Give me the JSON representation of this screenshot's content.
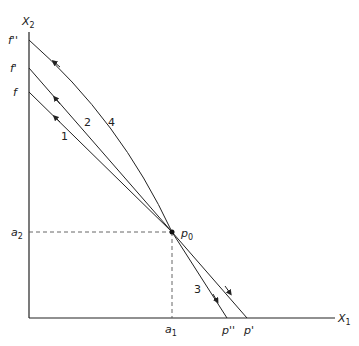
{
  "diagram": {
    "axes": {
      "y_label": "X",
      "y_label_sub": "2",
      "x_label": "X",
      "x_label_sub": "1"
    },
    "y_intercepts": {
      "f_double_prime": "f''",
      "f_prime": "f'",
      "f": "f"
    },
    "x_intercepts": {
      "p_double_prime": "p''",
      "p_prime": "p'"
    },
    "guides": {
      "a1": "a",
      "a1_sub": "1",
      "a2": "a",
      "a2_sub": "2"
    },
    "point": {
      "label": "p",
      "label_sub": "0"
    },
    "curve_labels": {
      "one": "1",
      "two": "2",
      "three": "3",
      "four": "4"
    }
  }
}
